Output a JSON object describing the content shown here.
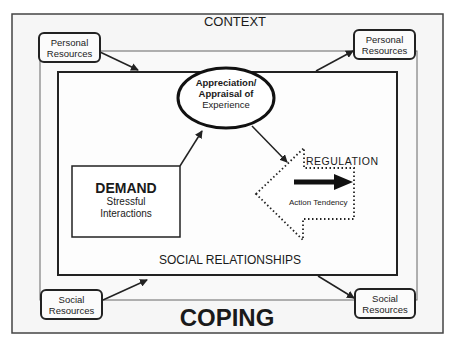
{
  "context_label": "CONTEXT",
  "resources": {
    "personal_left": {
      "line1": "Personal",
      "line2": "Resources"
    },
    "personal_right": {
      "line1": "Personal",
      "line2": "Resources"
    },
    "social_left": {
      "line1": "Social",
      "line2": "Resources"
    },
    "social_right": {
      "line1": "Social",
      "line2": "Resources"
    }
  },
  "appraisal": {
    "line1": "Appreciation/",
    "line2": "Appraisal of",
    "line3": "Experience"
  },
  "demand": {
    "title": "DEMAND",
    "line1": "Stressful",
    "line2": "Interactions"
  },
  "regulation": {
    "label": "REGULATION",
    "action": "Action Tendency"
  },
  "social_relationships_label": "SOCIAL RELATIONSHIPS",
  "coping_label": "COPING",
  "colors": {
    "line": "#222222",
    "background": "#f7f7f7",
    "frame": "#555555"
  }
}
